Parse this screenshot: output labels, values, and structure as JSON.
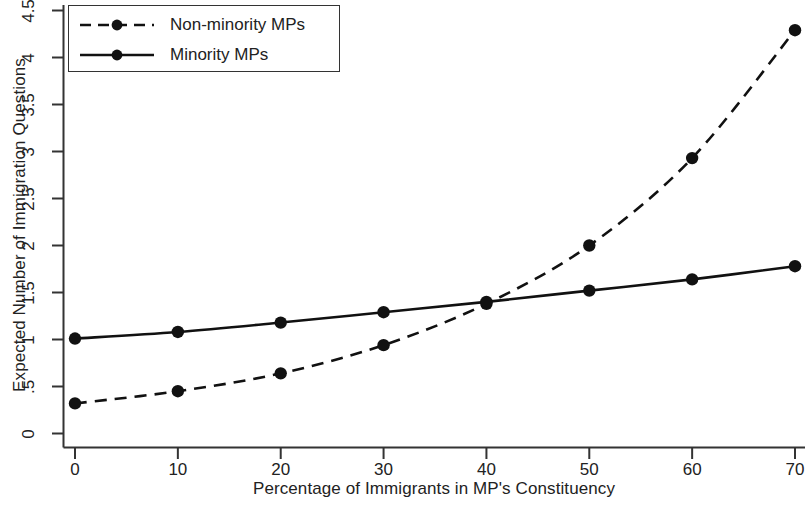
{
  "chart_data": {
    "type": "line",
    "title": "",
    "xlabel": "Percentage of Immigrants in MP's Constituency",
    "ylabel": "Expected Number of Immigration Questions",
    "x": [
      0,
      10,
      20,
      30,
      40,
      50,
      60,
      70
    ],
    "xlim": [
      -1.5,
      71.5
    ],
    "ylim": [
      -0.08,
      4.62
    ],
    "xticks": [
      0,
      10,
      20,
      30,
      40,
      50,
      60,
      70
    ],
    "xtick_labels": [
      "0",
      "10",
      "20",
      "30",
      "40",
      "50",
      "60",
      "70"
    ],
    "yticks": [
      0,
      0.5,
      1,
      1.5,
      2,
      2.5,
      3,
      3.5,
      4,
      4.5
    ],
    "ytick_labels": [
      "0",
      ".5",
      "1",
      "1.5",
      "2",
      "2.5",
      "3",
      "3.5",
      "4",
      "4.5"
    ],
    "grid": false,
    "legend_position": "top-left",
    "series": [
      {
        "name": "Non-minority MPs",
        "style": "dashed",
        "marker": "filled-circle",
        "color": "#111111",
        "values": [
          0.32,
          0.45,
          0.64,
          0.94,
          1.38,
          2.0,
          2.93,
          4.29
        ]
      },
      {
        "name": "Minority MPs",
        "style": "solid",
        "marker": "filled-circle",
        "color": "#111111",
        "values": [
          1.01,
          1.08,
          1.18,
          1.29,
          1.4,
          1.52,
          1.64,
          1.78
        ]
      }
    ]
  },
  "legend": {
    "entries": [
      {
        "label": "Non-minority MPs",
        "swatch": "dashed-line-marker-swatch"
      },
      {
        "label": "Minority MPs",
        "swatch": "solid-line-marker-swatch"
      }
    ]
  },
  "axes": {
    "x_title": "Percentage of Immigrants in MP's Constituency",
    "y_title": "Expected Number of Immigration Questions"
  }
}
